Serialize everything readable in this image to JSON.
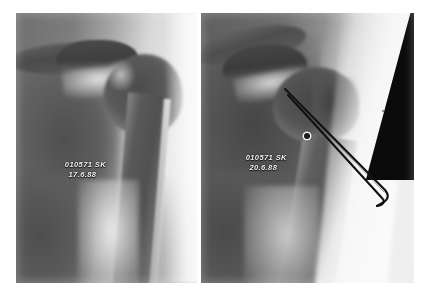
{
  "figure": {
    "background_color": "#ffffff",
    "width": 429,
    "height": 295
  },
  "panels": [
    {
      "id": "left",
      "name": "pre-procedure-radiograph",
      "view": "anteroposterior shoulder",
      "annotation": {
        "patient_id": "010571",
        "initials": "SK",
        "date": "17.6.88"
      },
      "colors": {
        "film_light": "#e9e9e9",
        "film_mid": "#8f8f8f",
        "bone_dark": "#4c4c4c",
        "text": "#f2f2f2"
      },
      "features": [
        "clavicle",
        "acromion",
        "glenohumeral joint space",
        "humeral head",
        "humeral shaft",
        "scapula",
        "soft tissue shadow"
      ],
      "hardware": []
    },
    {
      "id": "right",
      "name": "post-procedure-radiograph",
      "view": "anteroposterior shoulder",
      "annotation": {
        "patient_id": "010571",
        "initials": "SK",
        "date": "20.6.88"
      },
      "colors": {
        "film_light": "#efefef",
        "film_mid": "#8f8f8f",
        "bone_dark": "#474747",
        "collimation": "#0b0b0b",
        "text": "#f2f2f2"
      },
      "features": [
        "clavicle",
        "acromion",
        "glenohumeral joint space",
        "humeral head",
        "greater tuberosity",
        "humeral shaft",
        "collimated black corner"
      ],
      "hardware": [
        {
          "name": "hairpin-wire-implant",
          "type": "double-pronged metallic wire (hairpin staple)",
          "color": "#101010",
          "entry_point": {
            "x_pct": 40.0,
            "y_pct": 29.0
          },
          "bend_point": {
            "x_pct": 86.0,
            "y_pct": 66.5
          },
          "prong_separation_px": 5
        },
        {
          "name": "radiopaque-marker",
          "type": "small round marker",
          "color": "#1c1c1c",
          "position": {
            "x_pct": 48.5,
            "y_pct": 44.5
          },
          "diameter_px": 6
        }
      ]
    }
  ]
}
